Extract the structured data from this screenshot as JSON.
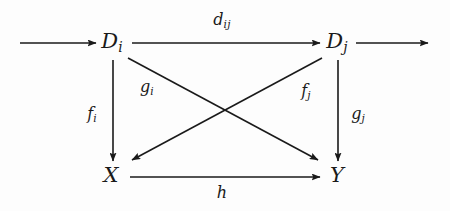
{
  "diagram": {
    "type": "commutative-diagram",
    "background_color": "#fdfdfd",
    "stroke_color": "#1a1a1a",
    "nodes": [
      {
        "id": "Di",
        "base": "D",
        "sub": "i",
        "x": 112,
        "y": 43
      },
      {
        "id": "Dj",
        "base": "D",
        "sub": "j",
        "x": 337,
        "y": 43
      },
      {
        "id": "X",
        "base": "X",
        "sub": "",
        "x": 111,
        "y": 177
      },
      {
        "id": "Y",
        "base": "Y",
        "sub": "",
        "x": 337,
        "y": 177
      }
    ],
    "edges": [
      {
        "id": "incoming",
        "from": "left-edge",
        "to": "Di",
        "base": "",
        "sub": "",
        "label_x": 0,
        "label_y": 0
      },
      {
        "id": "dij",
        "from": "Di",
        "to": "Dj",
        "base": "d",
        "sub": "ij",
        "label_x": 222,
        "label_y": 21
      },
      {
        "id": "outgoing",
        "from": "Dj",
        "to": "right-edge",
        "base": "",
        "sub": "",
        "label_x": 0,
        "label_y": 0
      },
      {
        "id": "fi",
        "from": "Di",
        "to": "X",
        "base": "f",
        "sub": "i",
        "label_x": 92,
        "label_y": 115
      },
      {
        "id": "gi",
        "from": "Di",
        "to": "Y",
        "base": "g",
        "sub": "i",
        "label_x": 147,
        "label_y": 88
      },
      {
        "id": "fj",
        "from": "Dj",
        "to": "X",
        "base": "f",
        "sub": "j",
        "label_x": 306,
        "label_y": 92
      },
      {
        "id": "gj",
        "from": "Dj",
        "to": "Y",
        "base": "g",
        "sub": "j",
        "label_x": 358,
        "label_y": 115
      },
      {
        "id": "h",
        "from": "X",
        "to": "Y",
        "base": "h",
        "sub": "",
        "label_x": 222,
        "label_y": 194
      }
    ]
  }
}
